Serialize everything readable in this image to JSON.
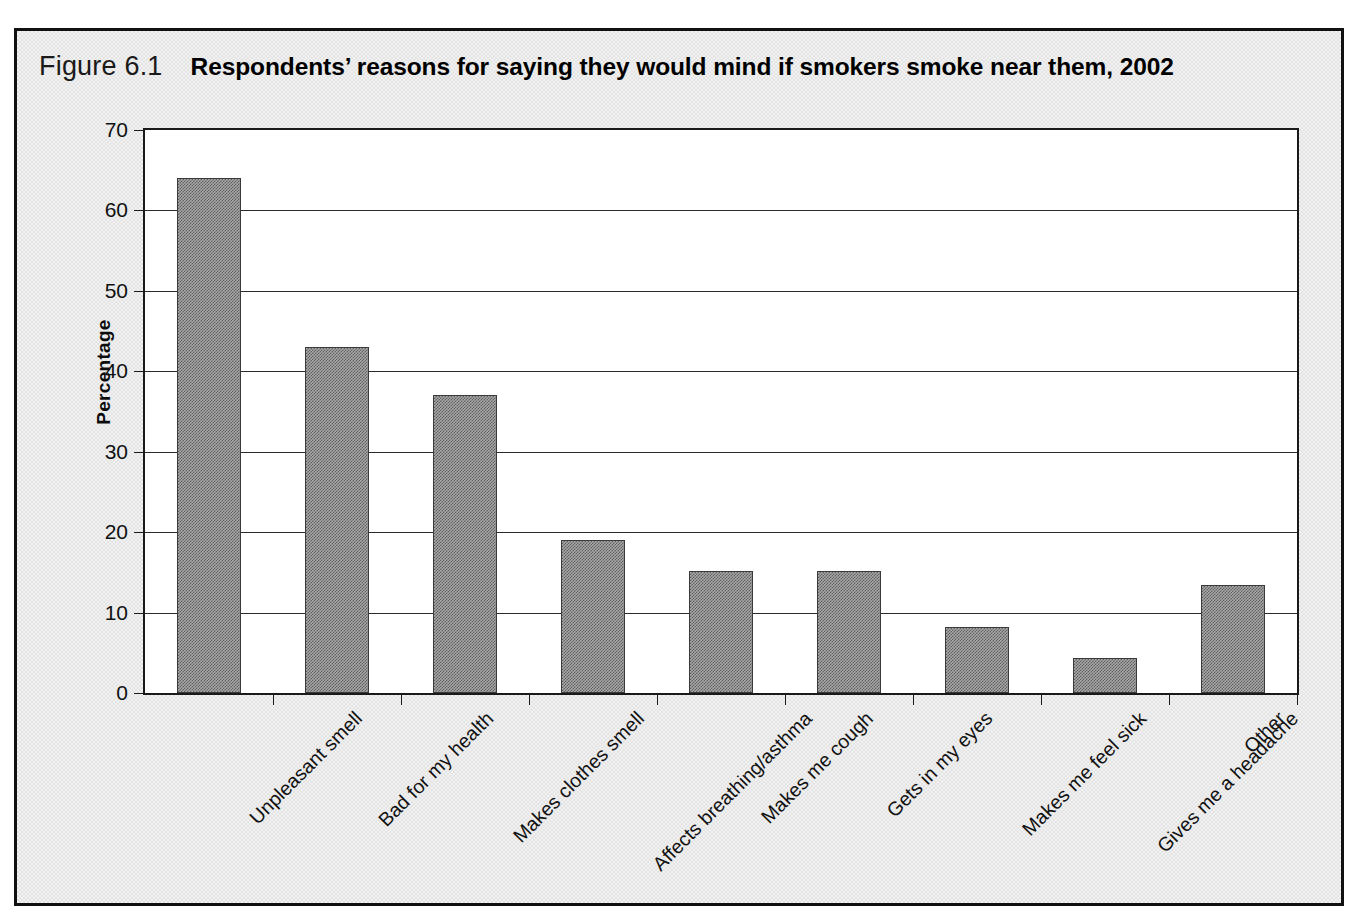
{
  "figure": {
    "number": "Figure 6.1",
    "title": "Respondents’ reasons for saying they would mind if smokers smoke near them, 2002"
  },
  "chart_data": {
    "type": "bar",
    "title": "Respondents’ reasons for saying they would mind if smokers smoke near them, 2002",
    "xlabel": "",
    "ylabel": "Percentage",
    "ylim": [
      0,
      70
    ],
    "ytick_values": [
      0,
      10,
      20,
      30,
      40,
      50,
      60,
      70
    ],
    "ytick_labels": [
      "0",
      "10",
      "20",
      "30",
      "40",
      "50",
      "60",
      "70"
    ],
    "grid": "horizontal",
    "legend": "none",
    "categories": [
      "Unpleasant smell",
      "Bad for my health",
      "Makes clothes smell",
      "Affects breathing/asthma",
      "Makes me cough",
      "Gets in my eyes",
      "Makes me feel sick",
      "Gives me a headache",
      "Other"
    ],
    "values": [
      64,
      43,
      37,
      19,
      15.2,
      15.2,
      8.2,
      4.3,
      13.4
    ],
    "bar_fill_color": "#808080",
    "bar_edge_color": "#3a3a3a",
    "plot_background": "#ffffff",
    "figure_background": "#e3e3e3"
  }
}
